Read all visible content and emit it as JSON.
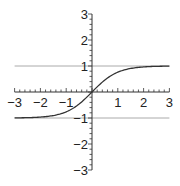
{
  "chart_data": {
    "type": "line",
    "title": "",
    "xlabel": "",
    "ylabel": "",
    "xlim": [
      -3,
      3
    ],
    "ylim": [
      -3,
      3
    ],
    "grid": false,
    "legend": null,
    "x_ticks": [
      -3,
      -2,
      -1,
      1,
      2,
      3
    ],
    "y_ticks": [
      -3,
      -2,
      -1,
      1,
      2,
      3
    ],
    "x_tick_labels": [
      "−3",
      "−2",
      "−1",
      "1",
      "2",
      "3"
    ],
    "y_tick_labels": [
      "−3",
      "−2",
      "−1",
      "1",
      "2",
      "3"
    ],
    "minor_tick_step": 0.2,
    "series": [
      {
        "name": "tanh(x)",
        "color": "#333333",
        "x": [
          -3,
          -2.5,
          -2,
          -1.5,
          -1,
          -0.5,
          0,
          0.5,
          1,
          1.5,
          2,
          2.5,
          3
        ],
        "y": [
          -0.995,
          -0.987,
          -0.964,
          -0.905,
          -0.762,
          -0.462,
          0,
          0.462,
          0.762,
          0.905,
          0.964,
          0.987,
          0.995
        ]
      }
    ],
    "reference_lines": [
      {
        "orientation": "horizontal",
        "y": 1,
        "color": "#aaaaaa"
      },
      {
        "orientation": "horizontal",
        "y": -1,
        "color": "#aaaaaa"
      }
    ]
  },
  "colors": {
    "axis": "#333333",
    "curve": "#333333",
    "asymptote": "#aaaaaa",
    "background": "#ffffff"
  }
}
